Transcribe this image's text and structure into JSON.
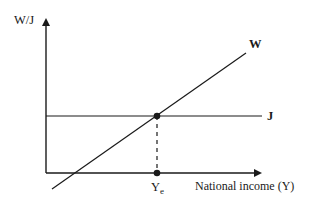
{
  "diagram": {
    "type": "economics-equilibrium",
    "y_axis_label": "W/J",
    "x_axis_label": "National income (Y)",
    "curves": [
      {
        "name": "W",
        "label": "W",
        "description": "withdrawals line, upward sloping"
      },
      {
        "name": "J",
        "label": "J",
        "description": "injections line, horizontal"
      }
    ],
    "equilibrium": {
      "label_main": "Y",
      "label_sub": "e",
      "description": "equilibrium national income where W = J"
    },
    "colors": {
      "line": "#1a1a1a",
      "background": "#ffffff"
    }
  }
}
